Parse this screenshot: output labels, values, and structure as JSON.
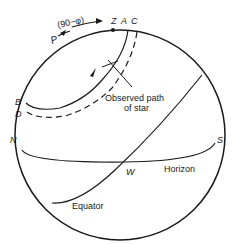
{
  "diagram": {
    "labels": {
      "P": "P",
      "angle": "(90−φ)",
      "Z": "Z",
      "A": "A",
      "C": "C",
      "B": "B",
      "D": "D",
      "N": "N",
      "S": "S",
      "W": "W",
      "horizon": "Horizon",
      "equator": "Equator",
      "observed_path_line1": "Observed path",
      "observed_path_line2": "of star"
    },
    "colors": {
      "stroke": "#1a1a1a",
      "background": "#ffffff"
    }
  }
}
